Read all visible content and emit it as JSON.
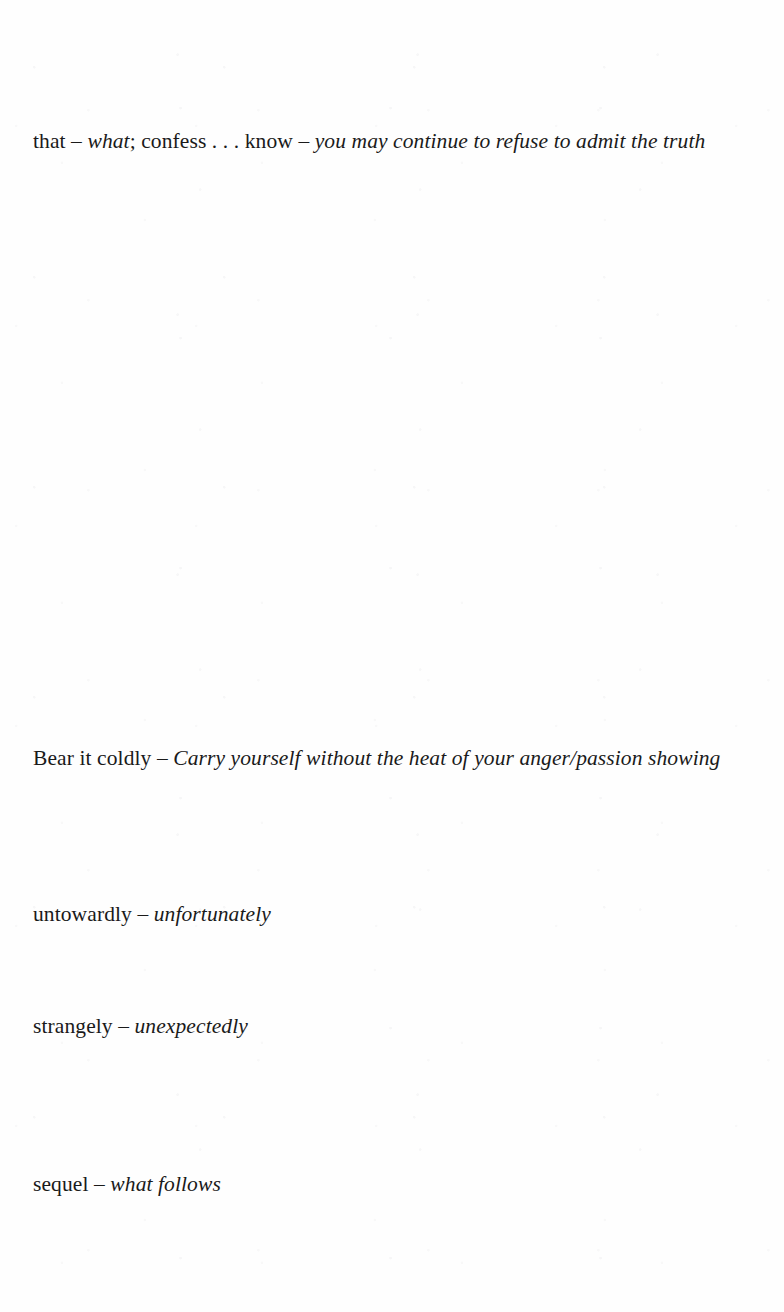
{
  "page": {
    "kind": "scanned-book-page",
    "section": "glossary",
    "background_color": "#fefefe",
    "text_color": "#1a1a1a",
    "separator": "–"
  },
  "entries": [
    {
      "id": "entry-that",
      "term": "that – ",
      "term_italic_part": "what",
      "term_tail": "; confess . . . know – ",
      "gloss": "you may continue to refuse to admit the truth",
      "top": 128,
      "mixed": true
    },
    {
      "id": "entry-bear-it-coldly",
      "term": "Bear it coldly ",
      "dash": "– ",
      "gloss": "Carry yourself without the heat of your anger/passion showing",
      "top": 745,
      "mixed": false
    },
    {
      "id": "entry-untowardly",
      "term": "untowardly ",
      "dash": "– ",
      "gloss": "unfortunately",
      "top": 901,
      "mixed": false
    },
    {
      "id": "entry-strangely",
      "term": "strangely ",
      "dash": "– ",
      "gloss": "unexpectedly",
      "top": 1013,
      "mixed": false
    },
    {
      "id": "entry-sequel",
      "term": "sequel ",
      "dash": "– ",
      "gloss": "what follows",
      "top": 1171,
      "mixed": false
    }
  ]
}
